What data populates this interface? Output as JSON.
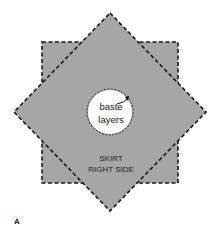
{
  "figure": {
    "panel_label": "A",
    "center_label_line1": "baste",
    "center_label_line2": "layers",
    "skirt_label_line1": "SKIRT",
    "skirt_label_line2": "RIGHT SIDE"
  },
  "colors": {
    "fabric_fill": "#a6a6a6",
    "stitch_line": "#1a1a1a",
    "center_hole": "#ffffff",
    "background": "#ffffff"
  }
}
